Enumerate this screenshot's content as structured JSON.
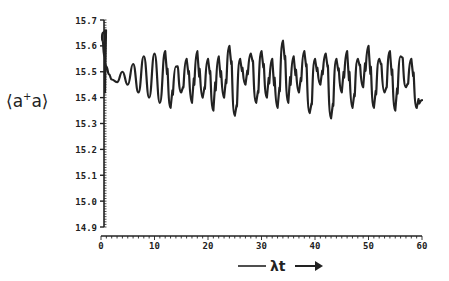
{
  "chart_data": {
    "type": "line",
    "title": "",
    "xlabel": "λt",
    "ylabel": "⟨a⁺a⟩",
    "xlim": [
      0,
      60
    ],
    "ylim": [
      14.9,
      15.7
    ],
    "x_ticks": [
      0,
      10,
      20,
      30,
      40,
      50,
      60
    ],
    "y_ticks": [
      14.9,
      15.0,
      15.1,
      15.2,
      15.3,
      15.4,
      15.5,
      15.6,
      15.7
    ],
    "x_tick_labels": [
      "0",
      "10",
      "20",
      "30",
      "40",
      "50",
      "60"
    ],
    "y_tick_labels": [
      "14.9",
      "15.0",
      "15.1",
      "15.2",
      "15.3",
      "15.4",
      "15.5",
      "15.6",
      "15.7"
    ],
    "grid": false,
    "legend": null,
    "annotations": [
      "arrow pointing right after λt label"
    ],
    "series": [
      {
        "name": "<a+a>",
        "color": "#222222",
        "description": "Starts near 15.65 at t=0, drops quickly to ~15.50, slow dip to ~15.45 around t≈2-3, then oscillations of growing amplitude; from t≈12 onward irregular fluctuations between ~15.30 and ~15.62 around mean ~15.48; ends ~15.39 at t=60",
        "x": [
          0,
          0.3,
          0.6,
          1.0,
          1.5,
          2.0,
          3.0,
          4.0,
          5.0,
          6.0,
          7.0,
          8.0,
          9.0,
          10.0,
          11.0,
          12.0,
          13.0,
          14.0,
          15.0,
          16.0,
          17.0,
          18.0,
          19.0,
          20.0,
          21.0,
          22.0,
          23.0,
          24.0,
          25.0,
          26.0,
          27.0,
          28.0,
          29.0,
          30.0,
          31.0,
          32.0,
          33.0,
          34.0,
          35.0,
          36.0,
          37.0,
          38.0,
          39.0,
          40.0,
          41.0,
          42.0,
          43.0,
          44.0,
          45.0,
          46.0,
          47.0,
          48.0,
          49.0,
          50.0,
          51.0,
          52.0,
          53.0,
          54.0,
          55.0,
          56.0,
          57.0,
          58.0,
          59.0,
          60.0
        ],
        "y": [
          15.65,
          15.62,
          15.56,
          15.52,
          15.49,
          15.47,
          15.46,
          15.5,
          15.45,
          15.53,
          15.42,
          15.56,
          15.4,
          15.57,
          15.38,
          15.58,
          15.36,
          15.52,
          15.42,
          15.55,
          15.38,
          15.58,
          15.4,
          15.55,
          15.35,
          15.56,
          15.4,
          15.6,
          15.33,
          15.55,
          15.45,
          15.57,
          15.38,
          15.58,
          15.4,
          15.55,
          15.36,
          15.62,
          15.38,
          15.56,
          15.42,
          15.58,
          15.34,
          15.55,
          15.45,
          15.57,
          15.32,
          15.55,
          15.42,
          15.58,
          15.36,
          15.55,
          15.44,
          15.6,
          15.36,
          15.55,
          15.42,
          15.58,
          15.35,
          15.56,
          15.44,
          15.55,
          15.36,
          15.39
        ]
      }
    ]
  }
}
